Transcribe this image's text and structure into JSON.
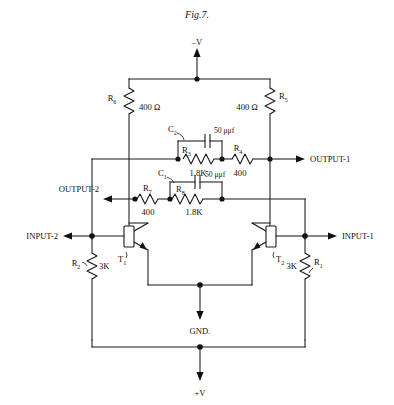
{
  "figure": {
    "title": "Fig.7.",
    "type": "schematic-diagram"
  },
  "rails": {
    "top_label": "–V",
    "mid_label": "GND.",
    "bottom_label": "+V"
  },
  "ports": {
    "output_1": "OUTPUT-1",
    "output_2": "OUTPUT-2",
    "input_1": "INPUT-1",
    "input_2": "INPUT-2"
  },
  "components": {
    "r1": {
      "ref": "R",
      "sub": "1",
      "value": "3K"
    },
    "r2": {
      "ref": "R",
      "sub": "2",
      "value": "3K"
    },
    "r3": {
      "ref": "R",
      "sub": "3",
      "value": "1.8K"
    },
    "r4": {
      "ref": "R",
      "sub": "4",
      "value": "400"
    },
    "r5": {
      "ref": "R",
      "sub": "5",
      "value": "400 Ω"
    },
    "r6": {
      "ref": "R",
      "sub": "6",
      "value": "400 Ω"
    },
    "r7": {
      "ref": "R",
      "sub": "7",
      "value": "400"
    },
    "r8": {
      "ref": "R",
      "sub": "8",
      "value": "1.8K"
    },
    "c1": {
      "ref": "C",
      "sub": "1",
      "value": "50 μμf"
    },
    "c2": {
      "ref": "C",
      "sub": "2",
      "value": "50 μμf"
    },
    "t1": {
      "ref": "T",
      "sub": "1"
    },
    "t2": {
      "ref": "T",
      "sub": "2"
    }
  },
  "colors": {
    "ink": "#1a1a1a",
    "paper": "#ffffff"
  }
}
